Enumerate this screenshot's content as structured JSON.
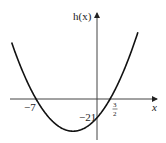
{
  "chart_data": {
    "type": "line",
    "title": "",
    "function": "h(x) = (x + 7)(2x - 3)",
    "xlabel": "x",
    "ylabel": "h(x)",
    "x_intercepts": [
      -7,
      1.5
    ],
    "x_intercept_labels": [
      "−7",
      "3",
      "2"
    ],
    "y_intercept": -21,
    "y_intercept_label": "−21",
    "xlim": [
      -9.8,
      4.8
    ],
    "ylim": [
      -38,
      56
    ],
    "grid": false,
    "series": [
      {
        "name": "h(x)",
        "color": "#111111"
      }
    ]
  }
}
